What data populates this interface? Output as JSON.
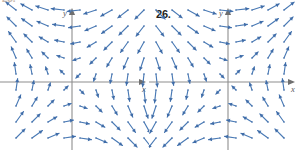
{
  "figure": {
    "type": "direction-field-pair",
    "background_color": "#ffffff",
    "arrow_color": "#4a7ab5",
    "arrow_head_color": "#3f6ca8",
    "axis_color": "#8e8e8e",
    "label_color": "#231f20"
  },
  "panels": [
    {
      "id": "left",
      "number_label": "25.",
      "number_label_visible": "partially-clipped",
      "x_axis_label": "x",
      "y_axis_label": "y",
      "axis_origin_px": {
        "x": 72,
        "y": 82
      },
      "grid_spacing_px": 16,
      "field": {
        "description": "clockwise rotational / saddle direction field",
        "quadrant_directions": {
          "quadrant_I": "left",
          "quadrant_II": "down",
          "quadrant_III": "right",
          "quadrant_IV": "up"
        }
      }
    },
    {
      "id": "right",
      "number_label": "26.",
      "number_label_visible": "visible",
      "x_axis_label": "x",
      "y_axis_label": "y",
      "axis_origin_px": {
        "x": 79,
        "y": 82
      },
      "grid_spacing_px": 16,
      "field": {
        "description": "counter-clockwise rotational direction field",
        "quadrant_directions": {
          "quadrant_I": "up",
          "quadrant_II": "right",
          "quadrant_III": "down",
          "quadrant_IV": "left"
        }
      }
    }
  ],
  "chart_data": [
    {
      "type": "scatter",
      "subtype": "vector-field",
      "title": "25.",
      "xlabel": "x",
      "ylabel": "y",
      "grid": false,
      "legend": null,
      "xlim": [
        -4.5,
        4.5
      ],
      "ylim": [
        -5,
        4.3
      ],
      "vector_formula": "u = -y, v = -x",
      "sample_x": [
        -4,
        -3,
        -2,
        -1,
        1,
        2,
        3,
        4
      ],
      "sample_y": [
        4,
        3,
        2,
        1,
        -1,
        -2,
        -3,
        -4
      ]
    },
    {
      "type": "scatter",
      "subtype": "vector-field",
      "title": "26.",
      "xlabel": "x",
      "ylabel": "y",
      "grid": false,
      "legend": null,
      "xlim": [
        -4.5,
        4.5
      ],
      "ylim": [
        -5,
        4.3
      ],
      "vector_formula": "u = y, v = x",
      "sample_x": [
        -4,
        -3,
        -2,
        -1,
        1,
        2,
        3,
        4
      ],
      "sample_y": [
        4,
        3,
        2,
        1,
        -1,
        -2,
        -3,
        -4
      ]
    }
  ]
}
